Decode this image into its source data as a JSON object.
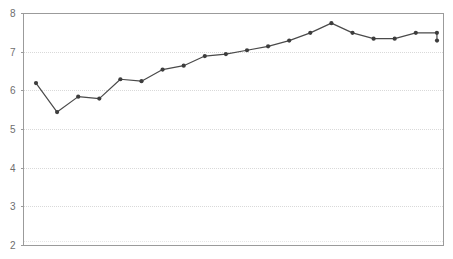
{
  "chart_data": {
    "type": "line",
    "title": "",
    "subtitle": "",
    "xlabel": "",
    "ylabel": "",
    "legend": [],
    "legend_position": "none",
    "grid": true,
    "grid_axis": "y",
    "xlim": [
      0,
      21
    ],
    "ylim": [
      2,
      8
    ],
    "y_ticks": [
      2,
      3,
      4,
      5,
      6,
      7,
      8
    ],
    "y_tick_labels": [
      "2",
      "3",
      "4",
      "5",
      "6",
      "7",
      "8"
    ],
    "x_ticks": [],
    "x_tick_labels": [],
    "x": [
      1,
      2,
      3,
      4,
      5,
      6,
      7,
      8,
      9,
      10,
      11,
      12,
      13,
      14,
      15,
      16,
      17,
      18,
      19,
      20
    ],
    "values": [
      6.2,
      5.45,
      5.85,
      5.8,
      6.3,
      6.25,
      6.55,
      6.65,
      6.9,
      6.95,
      7.05,
      7.15,
      7.3,
      7.5,
      7.75,
      7.5,
      7.35,
      7.35,
      7.5,
      7.5
    ],
    "series": [
      {
        "name": "series-1",
        "color": "#444444",
        "marker": "circle",
        "values": [
          6.2,
          5.45,
          5.85,
          5.8,
          6.3,
          6.25,
          6.55,
          6.65,
          6.9,
          6.95,
          7.05,
          7.15,
          7.3,
          7.5,
          7.75,
          7.5,
          7.35,
          7.35,
          7.5,
          7.5
        ]
      }
    ],
    "extra_point": {
      "x": 20.5,
      "value": 7.3
    },
    "colors": {
      "line": "#4a4a4a",
      "marker": "#3d3d3d",
      "grid": "#d9d9d9",
      "axis": "#9b9b9b",
      "tick_text": "#6e6e6e",
      "background": "#ffffff"
    }
  }
}
